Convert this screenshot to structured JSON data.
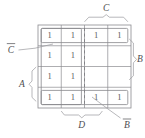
{
  "figure": {
    "kind": "karnaugh-map",
    "title": "",
    "variables": [
      "A",
      "B",
      "C",
      "D"
    ],
    "grid": {
      "rows": 4,
      "cols": 4,
      "cells": [
        [
          "1",
          "1",
          "1",
          "1"
        ],
        [
          "1",
          "1",
          "",
          ""
        ],
        [
          "1",
          "1",
          "",
          ""
        ],
        [
          "1",
          "1",
          "1",
          "1"
        ]
      ]
    },
    "labels": {
      "top_c": "C",
      "left_c_not": "C",
      "left_c_not_bar": true,
      "left_a": "A",
      "right_b": "B",
      "bottom_d": "D",
      "bottom_b_not": "B",
      "bottom_b_not_bar": true
    },
    "groups": [
      {
        "name": "top-row-group",
        "label": ""
      },
      {
        "name": "bottom-row-group",
        "label": ""
      },
      {
        "name": "left-columns-group",
        "label": ""
      }
    ],
    "colors": {
      "ink": "#59595c",
      "rule": "#8b8b8f",
      "brace": "#9a9a9e",
      "background": "#ffffff"
    }
  }
}
